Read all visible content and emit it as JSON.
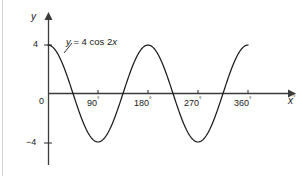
{
  "figure": {
    "background_color": "#ffffff",
    "border_color": "#d2d2d2",
    "curve_color": "#1c1c1c",
    "axis_color": "#3b3b3b"
  },
  "axes": {
    "y_axis_label": "y",
    "x_axis_label": "x",
    "x_axis_label_degree": "°",
    "origin_label": "0",
    "y_ticks": [
      {
        "label": "4",
        "value": 4
      },
      {
        "label": "−4",
        "value": -4
      }
    ],
    "x_ticks": [
      {
        "label": "90",
        "degree": "°",
        "value": 90
      },
      {
        "label": "180",
        "degree": "°",
        "value": 180
      },
      {
        "label": "270",
        "degree": "°",
        "value": 270
      },
      {
        "label": "360",
        "degree": "°",
        "value": 360
      }
    ]
  },
  "annotations": {
    "equation_label": "y = 4 cos 2x",
    "equation_y": "y",
    "equation_mid": " = 4 cos 2",
    "equation_x": "x"
  },
  "chart_data": {
    "type": "line",
    "title": "",
    "xlabel": "x°",
    "ylabel": "y",
    "xlim": [
      0,
      360
    ],
    "ylim": [
      -4,
      4
    ],
    "grid": false,
    "legend": "none",
    "annotations": [
      "y = 4 cos 2x"
    ],
    "xtick_labels": [
      "0",
      "90°",
      "180°",
      "270°",
      "360°"
    ],
    "xtick_values": [
      0,
      90,
      180,
      270,
      360
    ],
    "ytick_labels": [
      "4",
      "−4"
    ],
    "ytick_values": [
      4,
      -4
    ],
    "series": [
      {
        "name": "y = 4 cos 2x",
        "amplitude": 4,
        "period_degrees": 180,
        "x": [
          0,
          15,
          30,
          45,
          60,
          75,
          90,
          105,
          120,
          135,
          150,
          165,
          180,
          195,
          210,
          225,
          240,
          255,
          270,
          285,
          300,
          315,
          330,
          345,
          360
        ],
        "values": [
          4,
          3.46,
          2,
          0,
          -2,
          -3.46,
          -4,
          -3.46,
          -2,
          0,
          2,
          3.46,
          4,
          3.46,
          2,
          0,
          -2,
          -3.46,
          -4,
          -3.46,
          -2,
          0,
          2,
          3.46,
          4
        ]
      }
    ]
  }
}
